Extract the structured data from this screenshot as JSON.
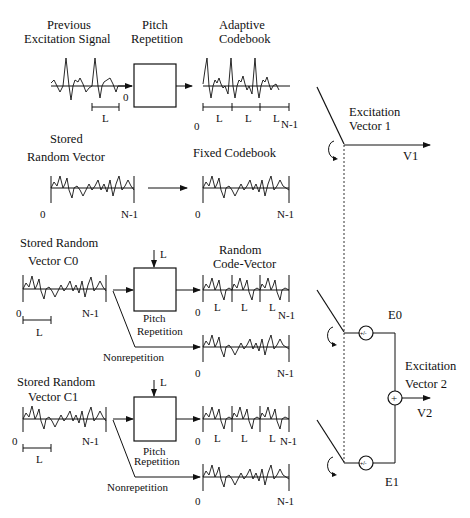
{
  "diagram": {
    "type": "block-diagram"
  },
  "row1": {
    "input_label_line1": "Previous",
    "input_label_line2": "Excitation  Signal",
    "block_label_line1": "Pitch",
    "block_label_line2": "Repetition",
    "output_label_line1": "Adaptive",
    "output_label_line2": "Codebook",
    "input_zero": "0",
    "input_L": "L",
    "out_zero": "0",
    "out_L1": "L",
    "out_L2": "L",
    "out_L3": "L",
    "out_end": "N-1"
  },
  "row2": {
    "input_label_line1": "Stored",
    "input_label_line2": "Random   Vector",
    "output_label": "Fixed   Codebook",
    "in_zero": "0",
    "in_end": "N-1",
    "out_zero": "0",
    "out_end": "N-1"
  },
  "row3": {
    "input_label_line1": "Stored  Random",
    "input_label_line2": "Vector   C0",
    "block_input": "L",
    "block_label_line1": "Pitch",
    "block_label_line2": "Repetition",
    "output_label_line1": "Random",
    "output_label_line2": "Code-Vector",
    "nonrep_label": "Nonrepetition",
    "in_zero": "0",
    "in_end": "N-1",
    "in_L": "L",
    "rep_zero": "0",
    "rep_L1": "L",
    "rep_L2": "L",
    "rep_L3": "L",
    "rep_end": "N-1",
    "nonrep_zero": "0",
    "nonrep_end": "N-1"
  },
  "row4": {
    "input_label_line1": "Stored  Random",
    "input_label_line2": "Vector   C1",
    "block_input": "L",
    "block_label_line1": "Pitch",
    "block_label_line2": "Repetition",
    "nonrep_label": "Nonrepetition",
    "in_zero": "0",
    "in_end": "N-1",
    "in_L": "L",
    "rep_zero": "0",
    "rep_L1": "L",
    "rep_L2": "L",
    "rep_L3": "L",
    "rep_end": "N-1",
    "nonrep_zero": "0",
    "nonrep_end": "N-1"
  },
  "right": {
    "v1_label_line1": "Excitation",
    "v1_label_line2": "Vector  1",
    "v1": "V1",
    "e0": "E0",
    "e1": "E1",
    "v2_label_line1": "Excitation",
    "v2_label_line2": "Vector  2",
    "v2": "V2",
    "sign_op": "+/-",
    "sum_op": "+"
  }
}
